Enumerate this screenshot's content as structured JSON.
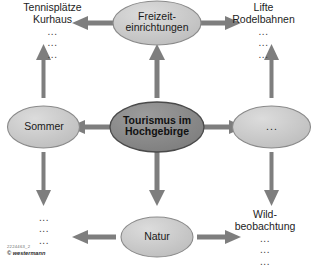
{
  "diagram": {
    "type": "mind-map",
    "title": "Tourismus im Hochgebirge",
    "center": {
      "id": "center",
      "label_line1": "Tourismus im",
      "label_line2": "Hochgebirge",
      "fill": "#8d8d8d",
      "stroke": "#4a4a4a"
    },
    "nodes": [
      {
        "id": "freizeiteinrichtungen",
        "position": "top",
        "label_line1": "Freizeit-",
        "label_line2": "einrichtungen",
        "fill": "#c9c9c9",
        "stroke": "#8a8a8a"
      },
      {
        "id": "sommer",
        "position": "left",
        "label_line1": "Sommer",
        "label_line2": "",
        "fill": "#c9c9c9",
        "stroke": "#8a8a8a"
      },
      {
        "id": "blank-right",
        "position": "right",
        "label_line1": "...",
        "label_line2": "",
        "fill": "#c9c9c9",
        "stroke": "#8a8a8a"
      },
      {
        "id": "natur",
        "position": "bottom",
        "label_line1": "Natur",
        "label_line2": "",
        "fill": "#c9c9c9",
        "stroke": "#8a8a8a"
      }
    ],
    "leaves": [
      {
        "id": "leaf-top-left",
        "heading_line1": "Tennisplätze",
        "heading_line2": "Kurhaus",
        "dots": [
          "...",
          "...",
          "..."
        ]
      },
      {
        "id": "leaf-top-right",
        "heading_line1": "Lifte",
        "heading_line2": "Rodelbahnen",
        "dots": [
          "...",
          "...",
          "..."
        ]
      },
      {
        "id": "leaf-bottom-left",
        "heading_line1": "",
        "heading_line2": "",
        "dots": [
          "...",
          "...",
          "..."
        ]
      },
      {
        "id": "leaf-bottom-right",
        "heading_line1": "Wild-",
        "heading_line2": "beobachtung",
        "dots": [
          "...",
          "...",
          "..."
        ]
      }
    ],
    "arrow_color": "#7e7e7e",
    "arrow_count": 8
  },
  "credit": {
    "id": "2224463_2",
    "publisher": "© westermann"
  }
}
